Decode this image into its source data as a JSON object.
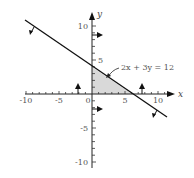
{
  "diagram": {
    "axes": {
      "x_label": "x",
      "y_label": "y",
      "x_ticks": [
        "-10",
        "-5",
        "0",
        "5",
        "10"
      ],
      "y_ticks": [
        "10",
        "5",
        "-5",
        "-10"
      ],
      "x_range": [
        -10,
        12
      ],
      "y_range": [
        -10,
        12
      ]
    },
    "line": {
      "equation": "2x + 3y = 12",
      "x_intercept": 6,
      "y_intercept": 4
    },
    "shaded_region": {
      "vertices": [
        [
          0,
          0
        ],
        [
          6,
          0
        ],
        [
          0,
          4
        ]
      ],
      "fill": "#d9d9d9"
    },
    "constraint_arrows": [
      {
        "target": "line",
        "direction": "down-left"
      },
      {
        "target": "y-axis",
        "direction": "right"
      },
      {
        "target": "x-axis",
        "direction": "up"
      }
    ],
    "colors": {
      "axis": "#222222",
      "line": "#111111",
      "shade": "#d9d9d9",
      "text": "#555555"
    }
  }
}
